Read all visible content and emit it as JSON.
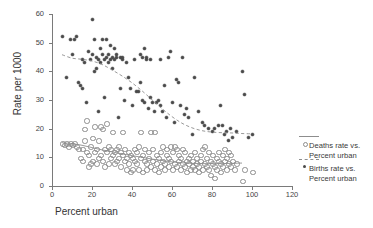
{
  "chart_data": {
    "type": "scatter",
    "title": "",
    "xlabel": "Percent urban",
    "ylabel": "Rate per 1000",
    "xlim": [
      0,
      120
    ],
    "ylim": [
      0,
      60
    ],
    "xticks": [
      0,
      20,
      40,
      60,
      80,
      100,
      120
    ],
    "yticks": [
      0,
      10,
      20,
      30,
      40,
      50,
      60
    ],
    "grid": false,
    "legend_position": "right",
    "series": [
      {
        "name": "Deaths rate vs. Percent urban",
        "marker": "open-circle",
        "line_style": "solid",
        "line_color": "#8d8d8d",
        "marker_color": "#8d8d8d",
        "points": [
          [
            5,
            15
          ],
          [
            6,
            14.5
          ],
          [
            7,
            15
          ],
          [
            8,
            14
          ],
          [
            9,
            15
          ],
          [
            10,
            14.5
          ],
          [
            11,
            15
          ],
          [
            12,
            14
          ],
          [
            13,
            13
          ],
          [
            14,
            10
          ],
          [
            15,
            9
          ],
          [
            15,
            13
          ],
          [
            16,
            16
          ],
          [
            16,
            20
          ],
          [
            17,
            23
          ],
          [
            17,
            12
          ],
          [
            18,
            11
          ],
          [
            18,
            7
          ],
          [
            19,
            8
          ],
          [
            19,
            14
          ],
          [
            20,
            9
          ],
          [
            20,
            17
          ],
          [
            21,
            21
          ],
          [
            21,
            12
          ],
          [
            22,
            13
          ],
          [
            22,
            8
          ],
          [
            23,
            10
          ],
          [
            23,
            16
          ],
          [
            24,
            11
          ],
          [
            24,
            21
          ],
          [
            25,
            20
          ],
          [
            25,
            9
          ],
          [
            26,
            13
          ],
          [
            26,
            7
          ],
          [
            27,
            12
          ],
          [
            27,
            22
          ],
          [
            28,
            14
          ],
          [
            28,
            8
          ],
          [
            29,
            10
          ],
          [
            29,
            13
          ],
          [
            30,
            19
          ],
          [
            30,
            11
          ],
          [
            31,
            8
          ],
          [
            31,
            12
          ],
          [
            32,
            13
          ],
          [
            32,
            9
          ],
          [
            33,
            10
          ],
          [
            33,
            14
          ],
          [
            34,
            12
          ],
          [
            34,
            7
          ],
          [
            35,
            11
          ],
          [
            35,
            19
          ],
          [
            36,
            9
          ],
          [
            36,
            13
          ],
          [
            37,
            10
          ],
          [
            37,
            6
          ],
          [
            38,
            12
          ],
          [
            38,
            8
          ],
          [
            39,
            11
          ],
          [
            39,
            5
          ],
          [
            40,
            10
          ],
          [
            40,
            6
          ],
          [
            41,
            13
          ],
          [
            41,
            9
          ],
          [
            42,
            8
          ],
          [
            42,
            12
          ],
          [
            43,
            14
          ],
          [
            43,
            6
          ],
          [
            44,
            10
          ],
          [
            44,
            19
          ],
          [
            45,
            11
          ],
          [
            45,
            5
          ],
          [
            46,
            9
          ],
          [
            46,
            13
          ],
          [
            47,
            8
          ],
          [
            47,
            6
          ],
          [
            48,
            12
          ],
          [
            48,
            10
          ],
          [
            49,
            19
          ],
          [
            49,
            7
          ],
          [
            50,
            9
          ],
          [
            50,
            13
          ],
          [
            51,
            19
          ],
          [
            51,
            6
          ],
          [
            52,
            11
          ],
          [
            52,
            8
          ],
          [
            53,
            10
          ],
          [
            53,
            5
          ],
          [
            54,
            12
          ],
          [
            54,
            7
          ],
          [
            55,
            9
          ],
          [
            55,
            14
          ],
          [
            56,
            8
          ],
          [
            56,
            6
          ],
          [
            57,
            11
          ],
          [
            57,
            13
          ],
          [
            58,
            7
          ],
          [
            58,
            10
          ],
          [
            59,
            9
          ],
          [
            59,
            14
          ],
          [
            60,
            6
          ],
          [
            60,
            12
          ],
          [
            61,
            14
          ],
          [
            61,
            8
          ],
          [
            62,
            13
          ],
          [
            62,
            7
          ],
          [
            63,
            9
          ],
          [
            63,
            11
          ],
          [
            64,
            6
          ],
          [
            64,
            10
          ],
          [
            65,
            8
          ],
          [
            65,
            13
          ],
          [
            66,
            7
          ],
          [
            66,
            12
          ],
          [
            67,
            9
          ],
          [
            67,
            5
          ],
          [
            68,
            10
          ],
          [
            68,
            8
          ],
          [
            69,
            6
          ],
          [
            69,
            11
          ],
          [
            70,
            9
          ],
          [
            70,
            7
          ],
          [
            71,
            12
          ],
          [
            71,
            6
          ],
          [
            72,
            8
          ],
          [
            72,
            10
          ],
          [
            73,
            7
          ],
          [
            73,
            5
          ],
          [
            74,
            9
          ],
          [
            74,
            11
          ],
          [
            75,
            6
          ],
          [
            75,
            13
          ],
          [
            76,
            8
          ],
          [
            76,
            14
          ],
          [
            77,
            7
          ],
          [
            77,
            10
          ],
          [
            78,
            12
          ],
          [
            78,
            6
          ],
          [
            79,
            9
          ],
          [
            79,
            4
          ],
          [
            80,
            8
          ],
          [
            80,
            11
          ],
          [
            81,
            7
          ],
          [
            81,
            3
          ],
          [
            82,
            10
          ],
          [
            82,
            6
          ],
          [
            83,
            9
          ],
          [
            83,
            12
          ],
          [
            84,
            8
          ],
          [
            84,
            5
          ],
          [
            85,
            11
          ],
          [
            85,
            7
          ],
          [
            86,
            13
          ],
          [
            86,
            9
          ],
          [
            87,
            6
          ],
          [
            87,
            10
          ],
          [
            88,
            8
          ],
          [
            88,
            12
          ],
          [
            89,
            7
          ],
          [
            89,
            11
          ],
          [
            90,
            9
          ],
          [
            91,
            6
          ],
          [
            92,
            8
          ],
          [
            95,
            2
          ],
          [
            96,
            6
          ],
          [
            100,
            5
          ]
        ],
        "trend": [
          [
            5,
            15.1
          ],
          [
            10,
            14.8
          ],
          [
            15,
            14.2
          ],
          [
            20,
            13.4
          ],
          [
            25,
            12.6
          ],
          [
            30,
            11.9
          ],
          [
            35,
            11.2
          ],
          [
            40,
            10.6
          ],
          [
            45,
            10.0
          ],
          [
            50,
            9.4
          ],
          [
            55,
            8.9
          ],
          [
            60,
            8.4
          ],
          [
            65,
            8.1
          ],
          [
            70,
            7.9
          ],
          [
            75,
            7.8
          ],
          [
            80,
            7.8
          ],
          [
            85,
            7.8
          ],
          [
            90,
            7.9
          ],
          [
            95,
            8.0
          ]
        ]
      },
      {
        "name": "Births rate vs. Percent urban",
        "marker": "filled-dot",
        "line_style": "dashed",
        "line_color": "#8d8d8d",
        "marker_color": "#4a4a4a",
        "points": [
          [
            5,
            52
          ],
          [
            7,
            38
          ],
          [
            9,
            51
          ],
          [
            10,
            46
          ],
          [
            11,
            51
          ],
          [
            12,
            52
          ],
          [
            13,
            36
          ],
          [
            14,
            35
          ],
          [
            15,
            34
          ],
          [
            15,
            44
          ],
          [
            16,
            43
          ],
          [
            17,
            29
          ],
          [
            18,
            47
          ],
          [
            19,
            44
          ],
          [
            20,
            58
          ],
          [
            20,
            46
          ],
          [
            21,
            51
          ],
          [
            21,
            40
          ],
          [
            22,
            45
          ],
          [
            22,
            41
          ],
          [
            23,
            26
          ],
          [
            23,
            44
          ],
          [
            24,
            48
          ],
          [
            24,
            43
          ],
          [
            25,
            51
          ],
          [
            25,
            46
          ],
          [
            26,
            44
          ],
          [
            26,
            31
          ],
          [
            27,
            51
          ],
          [
            27,
            45
          ],
          [
            28,
            43
          ],
          [
            28,
            46
          ],
          [
            29,
            49
          ],
          [
            29,
            44
          ],
          [
            30,
            45
          ],
          [
            30,
            41
          ],
          [
            31,
            48
          ],
          [
            31,
            44
          ],
          [
            32,
            46
          ],
          [
            32,
            45
          ],
          [
            33,
            24
          ],
          [
            34,
            45
          ],
          [
            34,
            34
          ],
          [
            35,
            44
          ],
          [
            35,
            45
          ],
          [
            36,
            30
          ],
          [
            37,
            43
          ],
          [
            38,
            38
          ],
          [
            39,
            34
          ],
          [
            40,
            28
          ],
          [
            41,
            44
          ],
          [
            42,
            33
          ],
          [
            43,
            33
          ],
          [
            44,
            46
          ],
          [
            44,
            36
          ],
          [
            45,
            45
          ],
          [
            45,
            30
          ],
          [
            46,
            48
          ],
          [
            46,
            29
          ],
          [
            47,
            45
          ],
          [
            47,
            44
          ],
          [
            48,
            27
          ],
          [
            49,
            44
          ],
          [
            49,
            31
          ],
          [
            50,
            29
          ],
          [
            51,
            26
          ],
          [
            52,
            29
          ],
          [
            53,
            30
          ],
          [
            54,
            44
          ],
          [
            54,
            28
          ],
          [
            55,
            26
          ],
          [
            56,
            35
          ],
          [
            57,
            24
          ],
          [
            58,
            45
          ],
          [
            59,
            47
          ],
          [
            60,
            29
          ],
          [
            61,
            22
          ],
          [
            62,
            37
          ],
          [
            63,
            36
          ],
          [
            64,
            28
          ],
          [
            65,
            45
          ],
          [
            66,
            25
          ],
          [
            67,
            27
          ],
          [
            68,
            24
          ],
          [
            70,
            18
          ],
          [
            71,
            38
          ],
          [
            73,
            26
          ],
          [
            75,
            22
          ],
          [
            76,
            21
          ],
          [
            78,
            20
          ],
          [
            80,
            19
          ],
          [
            81,
            20
          ],
          [
            83,
            21
          ],
          [
            84,
            28
          ],
          [
            85,
            21
          ],
          [
            86,
            18
          ],
          [
            87,
            19
          ],
          [
            88,
            16
          ],
          [
            89,
            20
          ],
          [
            90,
            17
          ],
          [
            92,
            19
          ],
          [
            95,
            40
          ],
          [
            96,
            32
          ],
          [
            98,
            17
          ],
          [
            100,
            18
          ]
        ],
        "trend": [
          [
            5,
            45.8
          ],
          [
            10,
            44.6
          ],
          [
            15,
            44.2
          ],
          [
            20,
            43.6
          ],
          [
            25,
            42.4
          ],
          [
            30,
            40.5
          ],
          [
            35,
            38.4
          ],
          [
            40,
            36.0
          ],
          [
            45,
            33.2
          ],
          [
            50,
            30.1
          ],
          [
            55,
            27.0
          ],
          [
            60,
            24.2
          ],
          [
            65,
            21.9
          ],
          [
            70,
            20.3
          ],
          [
            75,
            19.3
          ],
          [
            80,
            18.8
          ],
          [
            85,
            18.6
          ],
          [
            90,
            18.5
          ],
          [
            95,
            18.3
          ],
          [
            100,
            18.2
          ]
        ]
      }
    ]
  },
  "axes": {
    "x_label": "Percent urban",
    "y_label": "Rate per 1000",
    "x_tick_labels": [
      "0",
      "20",
      "40",
      "60",
      "80",
      "100",
      "120"
    ],
    "y_tick_labels": [
      "0",
      "10",
      "20",
      "30",
      "40",
      "50",
      "60"
    ]
  },
  "legend": {
    "entries": [
      {
        "line1": "Deaths rate vs.",
        "line2": "Percent urban"
      },
      {
        "line1": "Births rate vs.",
        "line2": "Percent urban"
      }
    ]
  },
  "colors": {
    "axis": "#7a7a7a",
    "deaths_marker": "#8d8d8d",
    "births_marker": "#4a4a4a",
    "trend_line": "#8d8d8d"
  }
}
